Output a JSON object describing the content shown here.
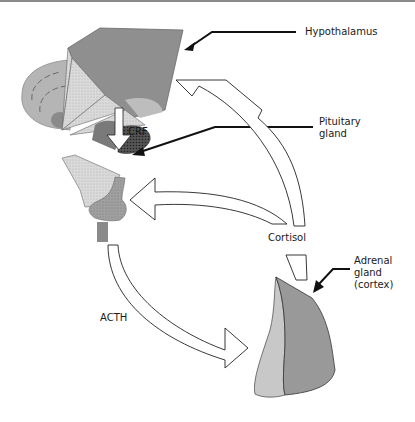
{
  "diagram": {
    "labels": {
      "hypothalamus": "Hypothalamus",
      "pituitary_line1": "Pituitary",
      "pituitary_line2": "gland",
      "crf": "CRF",
      "cortisol": "Cortisol",
      "acth": "ACTH",
      "adrenal_line1": "Adrenal",
      "adrenal_line2": "gland",
      "adrenal_line3": "(cortex)"
    },
    "colors": {
      "hypothalamus_fill": "#8f8f8f",
      "brain_fill": "#b5b5b5",
      "light_fill": "#dcdcdc",
      "pituitary_fill": "#9a9a9a",
      "adrenal_dark": "#999999",
      "adrenal_light": "#c8c8c8",
      "outline": "#222222"
    }
  }
}
